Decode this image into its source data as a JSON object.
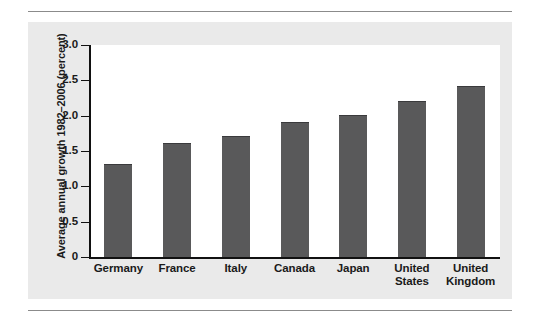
{
  "figure": {
    "panel_background": "#eaeaea",
    "plot_background": "#ffffff",
    "bar_color": "#59595a",
    "axis_color": "#111111",
    "rule_color": "#8b8b8b"
  },
  "chart_data": {
    "type": "bar",
    "title": "",
    "subtitle": "",
    "xlabel": "",
    "ylabel": "Average annual growth 1982–2006 (percent)",
    "categories": [
      "Germany",
      "France",
      "Italy",
      "Canada",
      "Japan",
      "United States",
      "United Kingdom"
    ],
    "category_lines": [
      [
        "Germany"
      ],
      [
        "France"
      ],
      [
        "Italy"
      ],
      [
        "Canada"
      ],
      [
        "Japan"
      ],
      [
        "United",
        "States"
      ],
      [
        "United",
        "Kingdom"
      ]
    ],
    "values": [
      1.3,
      1.6,
      1.7,
      1.9,
      2.0,
      2.2,
      2.4
    ],
    "ylim": [
      0,
      3.0
    ],
    "yticks": [
      0,
      0.5,
      1.0,
      1.5,
      2.0,
      2.5,
      3.0
    ],
    "ytick_labels": [
      "0",
      "0.5",
      "1.0",
      "1.5",
      "2.0",
      "2.5",
      "3.0"
    ],
    "grid": false,
    "legend": null,
    "legend_position": "none",
    "annotations": []
  }
}
